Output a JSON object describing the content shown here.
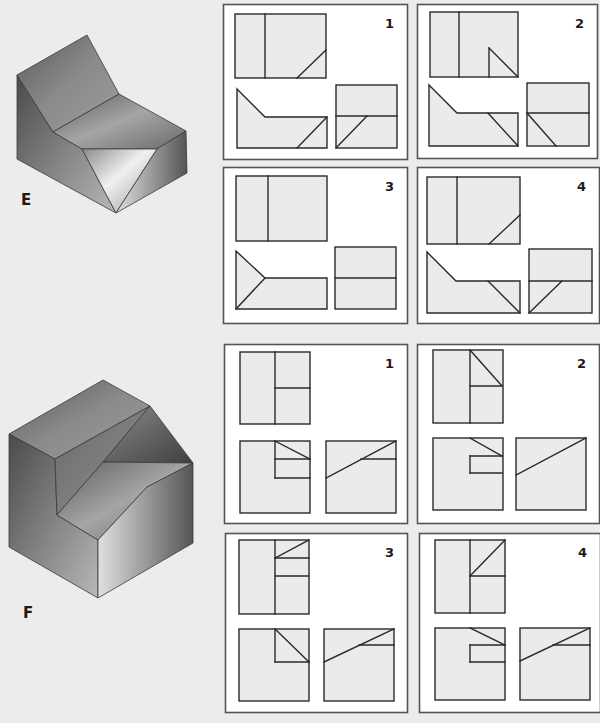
{
  "colors": {
    "page_bg": "#ececec",
    "box_bg": "#ffffff",
    "box_border": "#555555",
    "view_fill": "#ebebeb",
    "line": "#2a2a2a"
  },
  "problems": [
    {
      "id": "E",
      "label": "E",
      "label_pos": [
        21,
        193
      ],
      "solid": {
        "faces": [
          {
            "name": "left-face",
            "pts": "17,75 53,132 82,149 116,213 17,159",
            "grad": "gL"
          },
          {
            "name": "top-slope-face",
            "pts": "17,75 87,35 119,94 53,132",
            "grad": "gT"
          },
          {
            "name": "seat-face",
            "pts": "53,132 119,94 186,131 157,149 82,149",
            "grad": "gS"
          },
          {
            "name": "v-notch-face",
            "pts": "82,149 157,149 116,213",
            "grad": "gV"
          },
          {
            "name": "right-face",
            "pts": "157,149 186,131 187,173 116,213",
            "grad": "gR"
          }
        ]
      },
      "options": [
        {
          "number": "1",
          "box": [
            223,
            4,
            184,
            155
          ],
          "rects": [
            [
              235,
              14,
              91,
              64
            ],
            [
              336,
              85,
              61,
              63
            ]
          ],
          "polys": [
            "237,89 265,117 327,117 327,148 237,148"
          ],
          "lines": [
            [
              265,
              14,
              265,
              78
            ],
            [
              297,
              78,
              326,
              50
            ],
            [
              297,
              148,
              327,
              117
            ],
            [
              336,
              116,
              397,
              116
            ],
            [
              336,
              148,
              367,
              116
            ]
          ]
        },
        {
          "number": "2",
          "box": [
            417,
            4,
            180,
            154
          ],
          "rects": [
            [
              430,
              12,
              88,
              65
            ],
            [
              527,
              83,
              62,
              63
            ]
          ],
          "polys": [
            "429,85 457,113 518,113 518,146 429,146"
          ],
          "lines": [
            [
              459,
              12,
              459,
              77
            ],
            [
              489,
              77,
              489,
              48
            ],
            [
              489,
              48,
              518,
              77
            ],
            [
              488,
              113,
              518,
              146
            ],
            [
              527,
              113,
              589,
              113
            ],
            [
              527,
              113,
              556,
              146
            ]
          ]
        },
        {
          "number": "3",
          "box": [
            223,
            167,
            184,
            156
          ],
          "rects": [
            [
              236,
              176,
              91,
              65
            ],
            [
              335,
              247,
              61,
              62
            ]
          ],
          "polys": [
            "236,251 265,278 327,278 327,309 236,309"
          ],
          "lines": [
            [
              268,
              176,
              268,
              241
            ],
            [
              236,
              309,
              265,
              278
            ],
            [
              335,
              278,
              396,
              278
            ]
          ]
        },
        {
          "number": "4",
          "box": [
            417,
            167,
            182,
            156
          ],
          "rects": [
            [
              427,
              177,
              93,
              67
            ],
            [
              529,
              249,
              63,
              64
            ]
          ],
          "polys": [
            "427,252 456,281 520,281 520,313 427,313"
          ],
          "lines": [
            [
              457,
              177,
              457,
              244
            ],
            [
              489,
              244,
              520,
              215
            ],
            [
              488,
              281,
              520,
              313
            ],
            [
              529,
              281,
              592,
              281
            ],
            [
              529,
              313,
              562,
              281
            ]
          ]
        }
      ]
    },
    {
      "id": "F",
      "label": "F",
      "label_pos": [
        23,
        606
      ],
      "solid": {
        "faces": [
          {
            "name": "top-face",
            "pts": "9,434 103,380 150,406 55,459",
            "grad": "gT"
          },
          {
            "name": "left-face",
            "pts": "9,434 55,459 57,515 98,540 98,598 9,547",
            "grad": "gL"
          },
          {
            "name": "inner-wall-face",
            "pts": "55,459 150,406 103,462 57,515",
            "grad": "gW"
          },
          {
            "name": "slot-back-face",
            "pts": "150,406 193,463 103,462",
            "grad": "gK"
          },
          {
            "name": "ramp-face",
            "pts": "103,462 193,463 147,487 98,540 57,515",
            "grad": "gS"
          },
          {
            "name": "right-face",
            "pts": "147,487 193,463 193,543 98,598 98,540",
            "grad": "gR"
          }
        ]
      },
      "options": [
        {
          "number": "1",
          "box": [
            224,
            344,
            183,
            179
          ],
          "rects": [
            [
              240,
              352,
              70,
              72
            ],
            [
              240,
              441,
              70,
              72
            ],
            [
              326,
              441,
              70,
              72
            ]
          ],
          "polys": [],
          "lines": [
            [
              275,
              352,
              275,
              424
            ],
            [
              275,
              388,
              310,
              388
            ],
            [
              275,
              441,
              310,
              459
            ],
            [
              275,
              441,
              275,
              478
            ],
            [
              275,
              459,
              310,
              459
            ],
            [
              275,
              478,
              310,
              478
            ],
            [
              326,
              478,
              396,
              441
            ],
            [
              361,
              459,
              396,
              459
            ]
          ]
        },
        {
          "number": "2",
          "box": [
            417,
            344,
            182,
            179
          ],
          "rects": [
            [
              433,
              350,
              70,
              73
            ],
            [
              433,
              438,
              70,
              72
            ],
            [
              516,
              438,
              70,
              72
            ]
          ],
          "polys": [],
          "lines": [
            [
              470,
              350,
              470,
              423
            ],
            [
              470,
              350,
              502,
              386
            ],
            [
              470,
              386,
              502,
              386
            ],
            [
              470,
              438,
              502,
              456
            ],
            [
              470,
              456,
              502,
              456
            ],
            [
              470,
              456,
              470,
              473
            ],
            [
              470,
              473,
              502,
              473
            ],
            [
              516,
              475,
              586,
              438
            ]
          ]
        },
        {
          "number": "3",
          "box": [
            225,
            533,
            182,
            179
          ],
          "rects": [
            [
              239,
              540,
              70,
              74
            ],
            [
              239,
              629,
              70,
              72
            ],
            [
              324,
              629,
              70,
              72
            ]
          ],
          "polys": [],
          "lines": [
            [
              275,
              540,
              275,
              614
            ],
            [
              275,
              558,
              309,
              540
            ],
            [
              275,
              558,
              309,
              558
            ],
            [
              275,
              576,
              309,
              576
            ],
            [
              275,
              629,
              309,
              662
            ],
            [
              275,
              629,
              275,
              662
            ],
            [
              275,
              662,
              309,
              662
            ],
            [
              324,
              662,
              394,
              629
            ],
            [
              359,
              645,
              394,
              645
            ]
          ]
        },
        {
          "number": "4",
          "box": [
            419,
            533,
            181,
            179
          ],
          "rects": [
            [
              435,
              540,
              70,
              73
            ],
            [
              435,
              628,
              70,
              72
            ],
            [
              520,
              628,
              70,
              72
            ]
          ],
          "polys": [],
          "lines": [
            [
              470,
              540,
              470,
              613
            ],
            [
              470,
              576,
              505,
              540
            ],
            [
              470,
              576,
              505,
              576
            ],
            [
              470,
              628,
              505,
              645
            ],
            [
              470,
              645,
              505,
              645
            ],
            [
              470,
              645,
              470,
              662
            ],
            [
              470,
              662,
              505,
              662
            ],
            [
              520,
              661,
              590,
              628
            ],
            [
              553,
              645,
              590,
              645
            ]
          ]
        }
      ]
    }
  ]
}
